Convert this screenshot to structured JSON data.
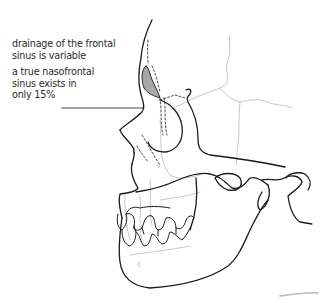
{
  "annotations": [
    {
      "id": "frontal-drainage",
      "lines": [
        "drainage of the frontal",
        "sinus is variable"
      ]
    },
    {
      "id": "nasofrontal-sinus",
      "lines": [
        "a true nasofrontal",
        "sinus exists in",
        "only 15%"
      ]
    }
  ],
  "colors": {
    "outline": "#1a1a1a",
    "suture": "#c8c8c8",
    "sinus_fill": "#a8a8a8",
    "text": "#2a2a2a"
  }
}
